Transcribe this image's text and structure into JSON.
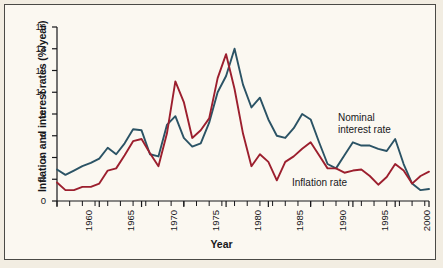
{
  "chart_data": {
    "type": "line",
    "title": "",
    "xlabel": "Year",
    "ylabel": "Inflation and interest rates (%/year)",
    "xlim": [
      1960,
      2004
    ],
    "ylim": [
      0,
      16
    ],
    "ytick_step": 2,
    "xtick_step": 5,
    "grid": false,
    "legend_position": "inline-annotation",
    "x": [
      1960,
      1961,
      1962,
      1963,
      1964,
      1965,
      1966,
      1967,
      1968,
      1969,
      1970,
      1971,
      1972,
      1973,
      1974,
      1975,
      1976,
      1977,
      1978,
      1979,
      1980,
      1981,
      1982,
      1983,
      1984,
      1985,
      1986,
      1987,
      1988,
      1989,
      1990,
      1991,
      1992,
      1993,
      1994,
      1995,
      1996,
      1997,
      1998,
      1999,
      2000,
      2001,
      2002,
      2003,
      2004
    ],
    "series": [
      {
        "name": "Nominal interest rate",
        "color": "#2b5365",
        "values": [
          2.9,
          2.4,
          2.8,
          3.2,
          3.5,
          3.9,
          4.9,
          4.3,
          5.3,
          6.6,
          6.5,
          4.3,
          4.1,
          7.0,
          7.8,
          5.8,
          5.0,
          5.3,
          7.2,
          10.0,
          11.5,
          14.0,
          10.7,
          8.6,
          9.5,
          7.5,
          6.0,
          5.8,
          6.7,
          8.0,
          7.5,
          5.4,
          3.4,
          3.0,
          4.2,
          5.4,
          5.1,
          5.1,
          4.8,
          4.6,
          5.7,
          3.4,
          1.6,
          1.0,
          1.1
        ]
      },
      {
        "name": "Inflation rate",
        "color": "#9c1f2e",
        "values": [
          1.7,
          1.0,
          1.0,
          1.3,
          1.3,
          1.6,
          2.8,
          3.0,
          4.2,
          5.5,
          5.7,
          4.4,
          3.2,
          6.2,
          11.0,
          9.1,
          5.8,
          6.5,
          7.6,
          11.3,
          13.5,
          10.3,
          6.2,
          3.2,
          4.3,
          3.6,
          1.9,
          3.6,
          4.1,
          4.8,
          5.4,
          4.2,
          3.0,
          3.0,
          2.6,
          2.8,
          2.9,
          2.3,
          1.5,
          2.2,
          3.4,
          2.8,
          1.6,
          2.3,
          2.7
        ]
      }
    ],
    "annotations": [
      {
        "text_line1": "Nominal",
        "text_line2": "interest rate",
        "series": "Nominal interest rate"
      },
      {
        "text_line1": "Inflation rate",
        "text_line2": "",
        "series": "Inflation rate"
      }
    ],
    "ytick_labels": [
      "0",
      "2",
      "4",
      "6",
      "8",
      "10",
      "12",
      "14",
      "16"
    ],
    "xtick_labels": [
      "1960",
      "1965",
      "1970",
      "1975",
      "1980",
      "1985",
      "1990",
      "1995",
      "2000",
      "2004"
    ]
  }
}
